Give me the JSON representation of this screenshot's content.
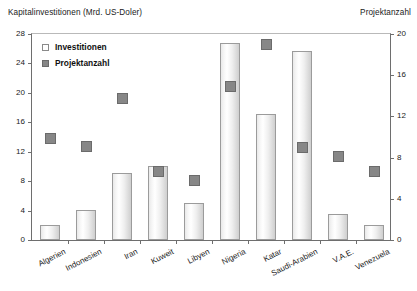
{
  "chart_data": {
    "type": "bar",
    "title": "",
    "xlabel": "",
    "ylabel": "Kapitalinvestitionen (Mrd. US-Doler)",
    "y2label": "Projektanzahl",
    "ylim": [
      0,
      28
    ],
    "y2lim": [
      0,
      20
    ],
    "yticks": [
      0,
      4,
      8,
      12,
      16,
      20,
      24,
      28
    ],
    "y2ticks": [
      0,
      4,
      8,
      12,
      16,
      20
    ],
    "grid": false,
    "legend_position": "top-left",
    "categories": [
      "Algerien",
      "Indonesien",
      "Iran",
      "Kuweit",
      "Libyen",
      "Nigeria",
      "Katar",
      "Saudi-Arabien",
      "V.A.E.",
      "Venezuela"
    ],
    "series": [
      {
        "name": "Investitionen",
        "type": "bar",
        "axis": "left",
        "unit": "Mrd. US-Dollar",
        "color": "#f0f0f0",
        "values": [
          2.0,
          4.0,
          9.0,
          10.0,
          5.0,
          26.5,
          17.0,
          25.4,
          3.5,
          2.0
        ]
      },
      {
        "name": "Projektanzahl",
        "type": "scatter",
        "axis": "right",
        "unit": "Anzahl",
        "color": "#878787",
        "values": [
          10.0,
          9.2,
          13.8,
          6.8,
          5.9,
          15.0,
          19.0,
          9.1,
          8.2,
          6.8
        ]
      }
    ]
  },
  "axes": {
    "left_title": "Kapitalinvestitionen (Mrd. US-Doler)",
    "right_title": "Projektanzahl",
    "left_ticks": [
      "28",
      "24",
      "20",
      "16",
      "12",
      "8",
      "4",
      "0"
    ],
    "right_ticks": [
      "20",
      "16",
      "12",
      "8",
      "4",
      "0"
    ]
  },
  "legend": {
    "items": [
      {
        "label": "Investitionen",
        "style": "open"
      },
      {
        "label": "Projektanzahl",
        "style": "solid"
      }
    ]
  }
}
